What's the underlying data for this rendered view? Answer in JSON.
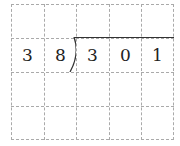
{
  "problem": {
    "divisor": [
      "3",
      "8"
    ],
    "dividend": [
      "3",
      "0",
      "1"
    ]
  },
  "grid": {
    "rows": 4,
    "cols": 5,
    "line_color": "#aaaaaa"
  }
}
